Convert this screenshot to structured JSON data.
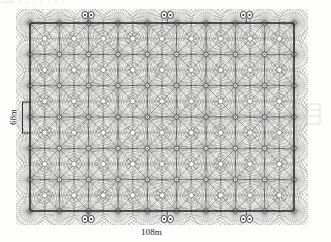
{
  "diagram": {
    "kind": "sprinkler-irrigation-layout",
    "field": {
      "width_label": "108m",
      "height_label": "68m",
      "outline_color": "#1c1c1c"
    },
    "ink": {
      "primary": "#2b2b2b",
      "spray": "#4a4a4a",
      "light": "#6e6e6e",
      "paper": "#fdfdfc"
    },
    "grid": {
      "columns": 9,
      "rows": 6,
      "head_symbol": "sprinkler-head-icon"
    },
    "valves": {
      "symbol": "valve-pair-icon",
      "top_count": 3,
      "bottom_count": 3,
      "top_positions_pct": [
        22,
        52,
        82
      ],
      "bottom_positions_pct": [
        22,
        52,
        82
      ]
    }
  }
}
